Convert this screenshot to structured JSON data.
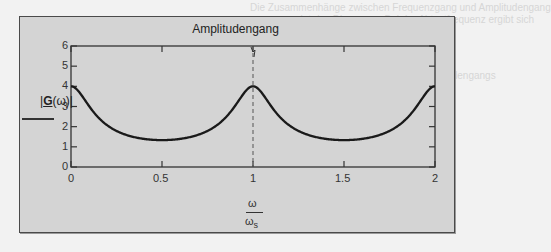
{
  "chart_data": {
    "type": "line",
    "title": "Amplitudengang",
    "xlabel": "ω / ω_s",
    "ylabel": "|G(ω)|",
    "x_ticks": [
      "0",
      "0.5",
      "1",
      "1.5",
      "2"
    ],
    "y_ticks": [
      "0",
      "1",
      "2",
      "3",
      "4",
      "5",
      "6"
    ],
    "xlim": [
      0,
      2
    ],
    "ylim": [
      0,
      6
    ],
    "grid": false,
    "marker_line": {
      "x": 1,
      "style": "dashed",
      "label": "1"
    },
    "series": [
      {
        "name": "|G(ω)|",
        "x": [
          0,
          0.1,
          0.2,
          0.3,
          0.4,
          0.5,
          0.6,
          0.7,
          0.8,
          0.9,
          1.0,
          1.1,
          1.2,
          1.3,
          1.4,
          1.5,
          1.6,
          1.7,
          1.8,
          1.9,
          2.0
        ],
        "values": [
          4.0,
          3.05,
          2.07,
          1.6,
          1.4,
          1.33,
          1.4,
          1.6,
          2.07,
          3.05,
          4.0,
          3.05,
          2.07,
          1.6,
          1.4,
          1.33,
          1.4,
          1.6,
          2.07,
          3.05,
          4.0
        ]
      }
    ]
  },
  "labels": {
    "title": "Amplitudengang",
    "ylabel_bold": "G",
    "ylabel_rest": "(ω)",
    "xlabel_num": "ω",
    "xlabel_den": "ω",
    "xlabel_den_sub": "s"
  },
  "background_text": [
    "Die Zusammenhänge zwischen Frequenzgang und Amplitudengang",
    "zeigt das Diagramm. Bei der Abtastfrequenz ergibt sich",
    "ein periodischer Verlauf",
    "des Amplitudengangs",
    "Darstellung im Frequenzbereich"
  ]
}
